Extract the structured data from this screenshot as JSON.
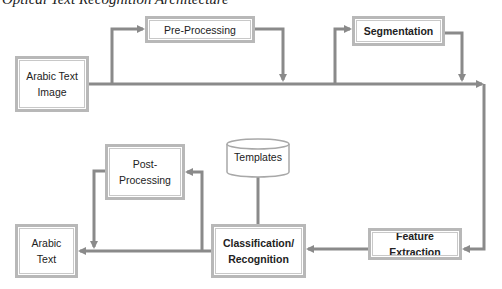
{
  "caption": "Optical Text Recognition Architecture",
  "nodes": {
    "input": {
      "label": "Arabic Text\nImage"
    },
    "preprocessing": {
      "label": "Pre-Processing"
    },
    "segmentation": {
      "label": "Segmentation"
    },
    "feature_extraction": {
      "label": "Feature Extraction"
    },
    "classification": {
      "label": "Classification/\nRecognition"
    },
    "templates": {
      "label": "Templates"
    },
    "postprocessing": {
      "label": "Post-\nProcessing"
    },
    "output": {
      "label": "Arabic\nText"
    }
  },
  "edges": [
    {
      "from": "Arabic Text Image",
      "to": "Pre-Processing"
    },
    {
      "from": "Pre-Processing",
      "to": "main-flow"
    },
    {
      "from": "main-flow",
      "to": "Segmentation"
    },
    {
      "from": "Segmentation",
      "to": "main-flow"
    },
    {
      "from": "main-flow",
      "to": "Feature Extraction"
    },
    {
      "from": "Feature Extraction",
      "to": "Classification/Recognition"
    },
    {
      "from": "Templates",
      "to": "Classification/Recognition"
    },
    {
      "from": "Classification/Recognition",
      "to": "Post-Processing"
    },
    {
      "from": "Post-Processing",
      "to": "Arabic Text"
    },
    {
      "from": "Classification/Recognition",
      "to": "Arabic Text"
    }
  ],
  "colors": {
    "line": "#8a8a8a",
    "box_border": "#b8b8b8"
  }
}
